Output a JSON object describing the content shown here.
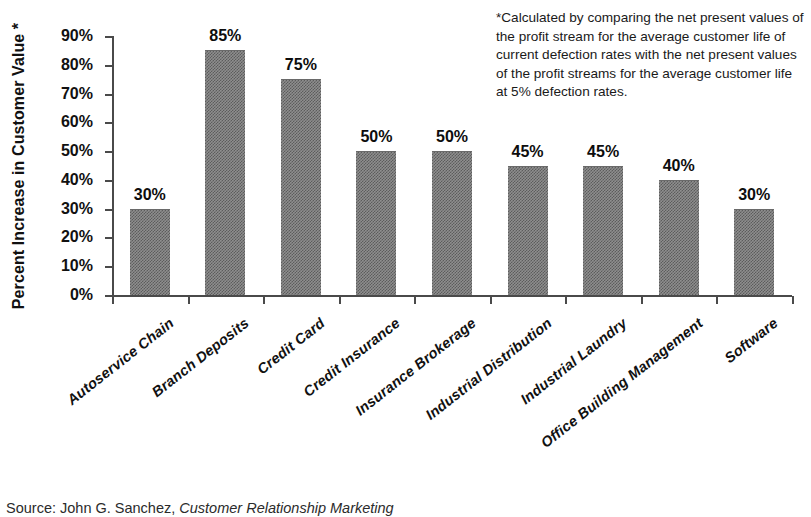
{
  "chart_data": {
    "type": "bar",
    "title": "",
    "subtitle": "",
    "xlabel": "",
    "ylabel": "Percent Increase in Customer Value *",
    "ylim": [
      0,
      90
    ],
    "ytick_step": 10,
    "grid": false,
    "legend": "none",
    "bar_color": "#8e8e8e",
    "axis_color": "#4a4a4a",
    "categories": [
      "Autoservice Chain",
      "Branch Deposits",
      "Credit Card",
      "Credit Insurance",
      "Insurance Brokerage",
      "Industrial Distribution",
      "Industrial Laundry",
      "Office Building Management",
      "Software"
    ],
    "values": [
      30,
      85,
      75,
      50,
      50,
      45,
      45,
      40,
      30
    ],
    "value_labels": [
      "30%",
      "85%",
      "75%",
      "50%",
      "50%",
      "45%",
      "45%",
      "40%",
      "30%"
    ],
    "ytick_labels": [
      "0%",
      "10%",
      "20%",
      "30%",
      "40%",
      "50%",
      "60%",
      "70%",
      "80%",
      "90%"
    ],
    "ytick_values": [
      0,
      10,
      20,
      30,
      40,
      50,
      60,
      70,
      80,
      90
    ]
  },
  "footnote": {
    "text": "*Calculated by comparing the net present values of the profit stream for the average customer life of current defection rates with the net present values of the profit streams for the average customer life at 5% defection rates."
  },
  "source": {
    "prefix": "Source:  John G. Sanchez, ",
    "title": "Customer Relationship Marketing"
  }
}
